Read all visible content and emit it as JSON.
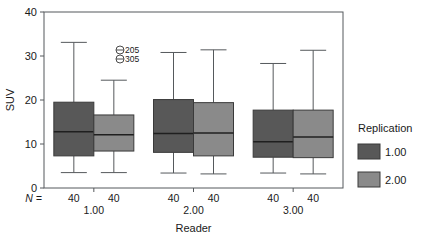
{
  "chart_data": {
    "type": "box",
    "title": "",
    "xlabel": "Reader",
    "ylabel": "SUV",
    "ylim": [
      0,
      40
    ],
    "yticks": [
      0,
      10,
      20,
      30,
      40
    ],
    "ytick_labels": [
      "0",
      "10",
      "20",
      "30",
      "40"
    ],
    "grid": false,
    "legend_position": "right",
    "legend_title": "Replication",
    "legend_entries": [
      {
        "label": "1.00",
        "color": "#585858"
      },
      {
        "label": "2.00",
        "color": "#8a8a8a"
      }
    ],
    "group_axis_label": "Reader",
    "groups": [
      "1.00",
      "2.00",
      "3.00"
    ],
    "n_prefix": "N =",
    "n_values": [
      "40",
      "40",
      "40",
      "40",
      "40",
      "40"
    ],
    "boxes": [
      {
        "group": "1.00",
        "replication": "1.00",
        "color": "#585858",
        "whisker_low": 3.5,
        "q1": 7.3,
        "median": 12.8,
        "q3": 19.5,
        "whisker_high": 33.1,
        "n": "40"
      },
      {
        "group": "1.00",
        "replication": "2.00",
        "color": "#8a8a8a",
        "whisker_low": 3.5,
        "q1": 8.4,
        "median": 12.1,
        "q3": 16.6,
        "whisker_high": 24.5,
        "n": "40"
      },
      {
        "group": "2.00",
        "replication": "1.00",
        "color": "#585858",
        "whisker_low": 3.4,
        "q1": 8.1,
        "median": 12.4,
        "q3": 20.1,
        "whisker_high": 30.8,
        "n": "40"
      },
      {
        "group": "2.00",
        "replication": "2.00",
        "color": "#8a8a8a",
        "whisker_low": 3.2,
        "q1": 7.3,
        "median": 12.5,
        "q3": 19.4,
        "whisker_high": 31.4,
        "n": "40"
      },
      {
        "group": "3.00",
        "replication": "1.00",
        "color": "#585858",
        "whisker_low": 3.4,
        "q1": 7.0,
        "median": 10.5,
        "q3": 17.7,
        "whisker_high": 28.3,
        "n": "40"
      },
      {
        "group": "3.00",
        "replication": "2.00",
        "color": "#8a8a8a",
        "whisker_low": 3.2,
        "q1": 6.9,
        "median": 11.6,
        "q3": 17.7,
        "whisker_high": 31.3,
        "n": "40"
      }
    ],
    "outliers": [
      {
        "label": "205",
        "value": 32.5,
        "marker": "circle"
      },
      {
        "label": "305",
        "value": 31.0,
        "marker": "circle"
      }
    ]
  }
}
